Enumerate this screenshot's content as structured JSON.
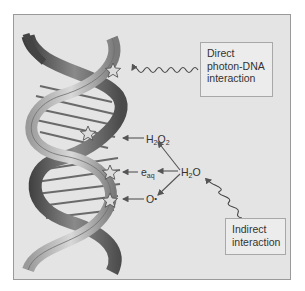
{
  "diagram": {
    "labels": {
      "direct": [
        "Direct",
        "photon-DNA",
        "interaction"
      ],
      "indirect": [
        "Indirect",
        "interaction"
      ]
    },
    "species": {
      "h2o2": {
        "base": "H",
        "sub": "2",
        "rest": "O",
        "sub2": "2"
      },
      "e_aq": {
        "base": "e",
        "sub": "aq"
      },
      "h2o": {
        "base": "H",
        "sub": "2",
        "rest": "O"
      },
      "o_radical": {
        "base": "O",
        "dot": "•"
      }
    },
    "colors": {
      "background": "#e4e4e4",
      "frame": "#9a9a9a",
      "strand_dark": "#4a4a4a",
      "strand_light": "#bdbdbd",
      "arrow": "#555555",
      "damage_star": "#d0d0d0"
    }
  }
}
